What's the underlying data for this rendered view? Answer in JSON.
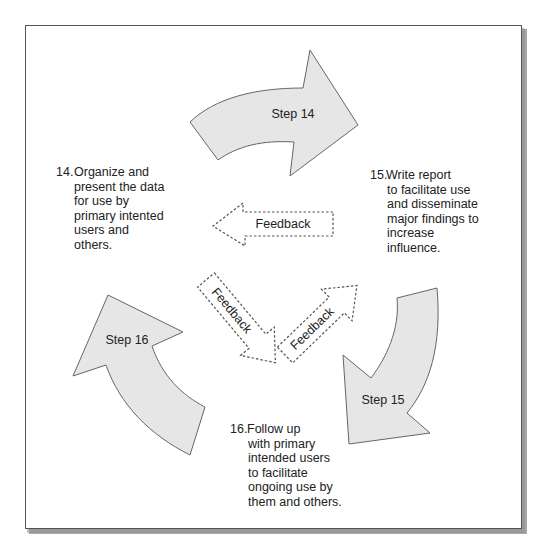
{
  "diagram": {
    "steps": [
      {
        "label": "Step 14"
      },
      {
        "label": "Step 15"
      },
      {
        "label": "Step 16"
      }
    ],
    "feedback": [
      {
        "label": "Feedback"
      },
      {
        "label": "Feedback"
      },
      {
        "label": "Feedback"
      }
    ],
    "descriptions": {
      "d14": {
        "number": "14.",
        "lines": [
          "Organize and",
          "present the data",
          "for use by",
          "primary intented",
          "users and",
          "others."
        ]
      },
      "d15": {
        "number": "15.",
        "lines": [
          "Write report",
          "to facilitate use",
          "and disseminate",
          "major findings to",
          "increase",
          "influence."
        ]
      },
      "d16": {
        "number": "16.",
        "lines": [
          "Follow up",
          "with primary",
          "intended users",
          "to facilitate",
          "ongoing use by",
          "them and others."
        ]
      }
    },
    "colors": {
      "arrow_fill": "#e6e6e6",
      "arrow_stroke": "#666666",
      "frame_stroke": "#555555",
      "shadow": "#9a9a9a"
    }
  }
}
